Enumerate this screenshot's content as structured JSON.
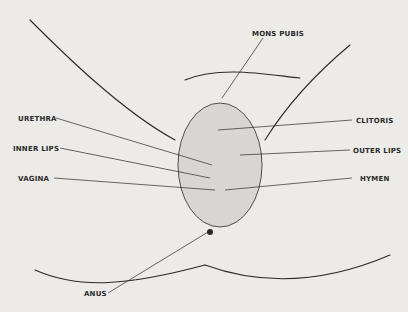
{
  "diagram": {
    "type": "anatomical-labeled-diagram",
    "colors": {
      "background": "#ecebe8",
      "ink": "#2a2a2a"
    },
    "labels": {
      "mons_pubis": "MONS PUBIS",
      "urethra": "URETHRA",
      "inner_lips": "INNER LIPS",
      "vagina": "VAGINA",
      "clitoris": "CLITORIS",
      "outer_lips": "OUTER LIPS",
      "hymen": "HYMEN",
      "anus": "ANUS"
    }
  }
}
